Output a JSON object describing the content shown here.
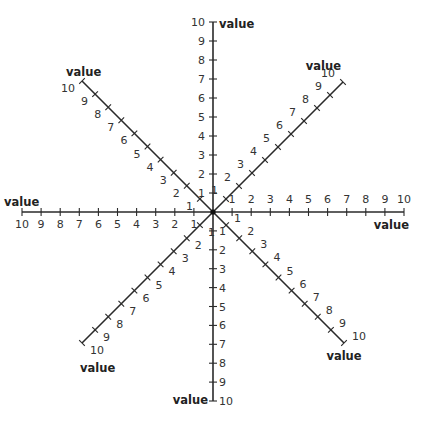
{
  "diagram": {
    "center": [
      213,
      212
    ],
    "tick_values": [
      1,
      2,
      3,
      4,
      5,
      6,
      7,
      8,
      9,
      10
    ],
    "colors": {
      "line": "#2a2a2a",
      "text": "#333333",
      "title": "#222222"
    },
    "axes": [
      {
        "id": "north",
        "label": "value",
        "dir": [
          0,
          -1
        ],
        "unit": 19.0,
        "label_pos": [
          219,
          28
        ],
        "label_anchor": "start",
        "tick_label_offset": [
          -8,
          4
        ],
        "tick_label_anchor": "end"
      },
      {
        "id": "south",
        "label": "value",
        "dir": [
          0,
          1
        ],
        "unit": 18.9,
        "label_pos": [
          208,
          404
        ],
        "label_anchor": "end",
        "tick_label_offset": [
          6,
          4
        ],
        "tick_label_anchor": "start"
      },
      {
        "id": "east",
        "label": "value",
        "dir": [
          1,
          0
        ],
        "unit": 19.1,
        "label_pos": [
          409,
          229
        ],
        "label_anchor": "end",
        "tick_label_offset": [
          0,
          -9
        ],
        "tick_label_anchor": "middle"
      },
      {
        "id": "west",
        "label": "value",
        "dir": [
          -1,
          0
        ],
        "unit": 19.1,
        "label_pos": [
          4,
          206
        ],
        "label_anchor": "start",
        "tick_label_offset": [
          0,
          16
        ],
        "tick_label_anchor": "middle"
      },
      {
        "id": "north-east",
        "label": "value",
        "dir": [
          1,
          -1
        ],
        "unit": 13.0,
        "label_pos": [
          341,
          70
        ],
        "label_anchor": "end",
        "tick_label_offset": [
          -8,
          -5
        ],
        "tick_label_anchor": "end"
      },
      {
        "id": "north-west",
        "label": "value",
        "dir": [
          -1,
          -1
        ],
        "unit": 13.1,
        "label_pos": [
          66,
          76
        ],
        "label_anchor": "start",
        "tick_label_offset": [
          -7,
          11
        ],
        "tick_label_anchor": "end"
      },
      {
        "id": "south-east",
        "label": "value",
        "dir": [
          1,
          1
        ],
        "unit": 13.1,
        "label_pos": [
          344,
          360
        ],
        "label_anchor": "middle",
        "tick_label_offset": [
          8,
          -3
        ],
        "tick_label_anchor": "start"
      },
      {
        "id": "south-west",
        "label": "value",
        "dir": [
          -1,
          1
        ],
        "unit": 13.1,
        "label_pos": [
          80,
          372
        ],
        "label_anchor": "start",
        "tick_label_offset": [
          8,
          11
        ],
        "tick_label_anchor": "start"
      }
    ]
  }
}
